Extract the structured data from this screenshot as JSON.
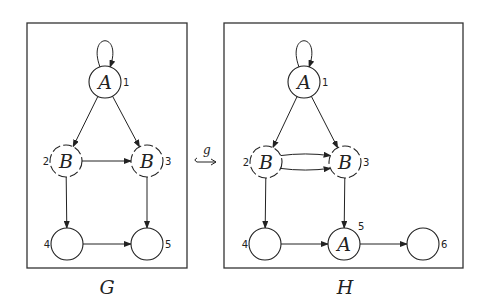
{
  "morphism": {
    "label": "g",
    "symbol": "hook-arrow"
  },
  "graphs": [
    {
      "name": "G",
      "box": {
        "x": 27,
        "y": 23,
        "w": 160,
        "h": 245
      },
      "label_pos": [
        107,
        294
      ],
      "nodes": [
        {
          "id": "1",
          "label": "A",
          "x": 105,
          "y": 82,
          "dashed": false,
          "idx_pos": "right",
          "self_loop": true
        },
        {
          "id": "2",
          "label": "B",
          "x": 66,
          "y": 161,
          "dashed": true,
          "idx_pos": "left"
        },
        {
          "id": "3",
          "label": "B",
          "x": 147,
          "y": 161,
          "dashed": true,
          "idx_pos": "right"
        },
        {
          "id": "4",
          "label": "",
          "x": 67,
          "y": 244,
          "dashed": false,
          "idx_pos": "left"
        },
        {
          "id": "5",
          "label": "",
          "x": 147,
          "y": 244,
          "dashed": false,
          "idx_pos": "right"
        }
      ],
      "edges": [
        {
          "from": "1",
          "to": "2"
        },
        {
          "from": "1",
          "to": "3"
        },
        {
          "from": "2",
          "to": "3"
        },
        {
          "from": "2",
          "to": "4"
        },
        {
          "from": "3",
          "to": "5"
        },
        {
          "from": "4",
          "to": "5"
        }
      ]
    },
    {
      "name": "H",
      "box": {
        "x": 224,
        "y": 23,
        "w": 239,
        "h": 245
      },
      "label_pos": [
        345,
        294
      ],
      "nodes": [
        {
          "id": "1",
          "label": "A",
          "x": 304,
          "y": 82,
          "dashed": false,
          "idx_pos": "right",
          "self_loop": true
        },
        {
          "id": "2",
          "label": "B",
          "x": 266,
          "y": 162,
          "dashed": true,
          "idx_pos": "left"
        },
        {
          "id": "3",
          "label": "B",
          "x": 345,
          "y": 162,
          "dashed": true,
          "idx_pos": "right"
        },
        {
          "id": "4",
          "label": "",
          "x": 265,
          "y": 244,
          "dashed": false,
          "idx_pos": "left"
        },
        {
          "id": "5",
          "label": "A",
          "x": 344,
          "y": 244,
          "dashed": false,
          "idx_pos": "topright"
        },
        {
          "id": "6",
          "label": "",
          "x": 423,
          "y": 244,
          "dashed": false,
          "idx_pos": "right"
        }
      ],
      "edges": [
        {
          "from": "1",
          "to": "2"
        },
        {
          "from": "1",
          "to": "3"
        },
        {
          "from": "2",
          "to": "3",
          "curve": -7
        },
        {
          "from": "2",
          "to": "3",
          "curve": 7
        },
        {
          "from": "2",
          "to": "4"
        },
        {
          "from": "3",
          "to": "5"
        },
        {
          "from": "4",
          "to": "5"
        },
        {
          "from": "5",
          "to": "6"
        }
      ]
    }
  ]
}
